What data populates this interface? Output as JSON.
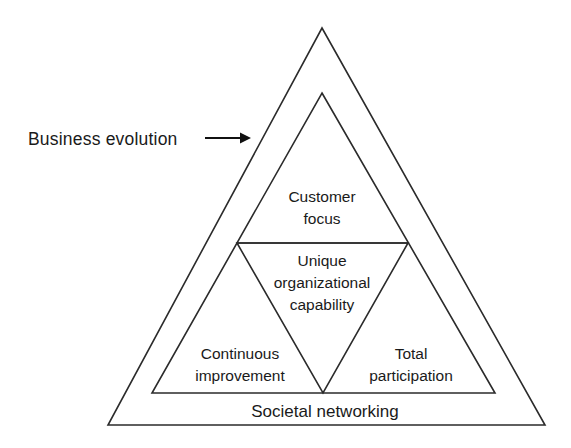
{
  "diagram": {
    "type": "nested-triangle-pyramid",
    "background_color": "#ffffff",
    "line_color": "#2b2b2b",
    "text_color": "#1a1a1a",
    "callout": {
      "label": "Business  evolution",
      "arrow_name": "right-arrow"
    },
    "zones": {
      "top": {
        "name": "customer-focus",
        "lines": [
          "Customer",
          "focus"
        ]
      },
      "center": {
        "name": "unique-organizational-capability",
        "lines": [
          "Unique",
          "organizational",
          "capability"
        ]
      },
      "bottom_left": {
        "name": "continuous-improvement",
        "lines": [
          "Continuous",
          "improvement"
        ]
      },
      "bottom_right": {
        "name": "total-participation",
        "lines": [
          "Total",
          "participation"
        ]
      },
      "outer_base": {
        "name": "societal-networking",
        "lines": [
          "Societal networking"
        ]
      }
    },
    "geometry": {
      "outer_triangle": "322,28 545,425 108,425",
      "inner_triangle": "322,93 495,393 152,393",
      "midline": {
        "x1": 237,
        "y1": 243,
        "x2": 408,
        "y2": 243
      },
      "inverted_triangle": "237,243 408,243 323,393",
      "arrow": {
        "x1": 205,
        "y1": 138,
        "x2": 250,
        "y2": 138
      }
    }
  }
}
